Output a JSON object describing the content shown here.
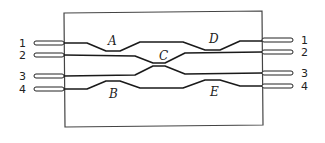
{
  "diagram": {
    "type": "optical waveguide coupler network",
    "left_ports": [
      {
        "label": "1",
        "y": 43
      },
      {
        "label": "2",
        "y": 55
      },
      {
        "label": "3",
        "y": 76
      },
      {
        "label": "4",
        "y": 89
      }
    ],
    "right_ports": [
      {
        "label": "1",
        "y": 40
      },
      {
        "label": "2",
        "y": 52
      },
      {
        "label": "3",
        "y": 73
      },
      {
        "label": "4",
        "y": 86
      }
    ],
    "couplers": [
      {
        "label": "A",
        "between": [
          "1",
          "2"
        ]
      },
      {
        "label": "B",
        "between": [
          "3",
          "4"
        ]
      },
      {
        "label": "C",
        "between": [
          "2",
          "3"
        ]
      },
      {
        "label": "D",
        "between": [
          "1",
          "2"
        ]
      },
      {
        "label": "E",
        "between": [
          "3",
          "4"
        ]
      }
    ],
    "colors": {
      "line": "#1a1a1a",
      "box": "#444444",
      "background": "#ffffff"
    }
  }
}
